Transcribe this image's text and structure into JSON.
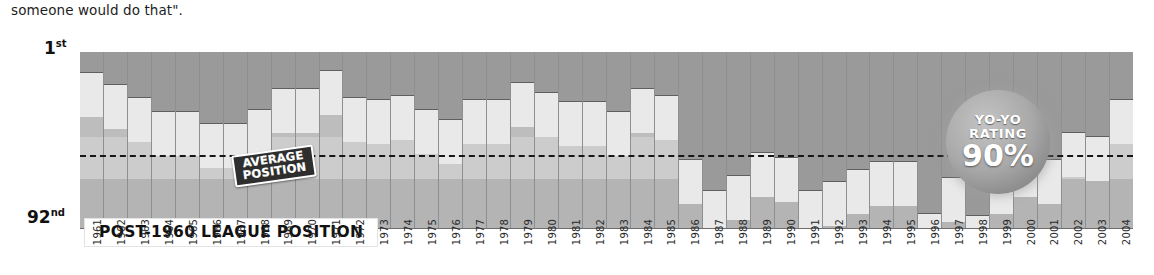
{
  "caption": "someone would do that\".",
  "axis": {
    "top_label": "1",
    "top_sup": "st",
    "bottom_label": "92",
    "bottom_sup": "nd"
  },
  "banner": {
    "text": "POST-1960 LEAGUE POSITION"
  },
  "average_badge": {
    "line1": "AVERAGE",
    "line2": "POSITION"
  },
  "yoyo_badge": {
    "line1": "YO-YO",
    "line2": "RATING",
    "value": "90%"
  },
  "colors": {
    "bar": "#9a9a9a",
    "bar_tail": "#e9e9e9",
    "plot_bg": "#b6b6b6",
    "band_light": "#cccccc",
    "avg_line": "#161616",
    "banner_bg": "#ffffff"
  },
  "chart_data": {
    "type": "bar",
    "title": "POST-1960 LEAGUE POSITION",
    "xlabel": "",
    "ylabel": "League position",
    "ylim": [
      1,
      92
    ],
    "y_inverted": true,
    "grid": false,
    "legend": "none",
    "annotations": [
      "AVERAGE POSITION",
      "YO-YO RATING 90%"
    ],
    "average_position": 46,
    "categories": [
      "1961",
      "1962",
      "1963",
      "1964",
      "1965",
      "1966",
      "1967",
      "1968",
      "1969",
      "1970",
      "1971",
      "1972",
      "1973",
      "1974",
      "1975",
      "1976",
      "1977",
      "1978",
      "1979",
      "1980",
      "1981",
      "1982",
      "1983",
      "1984",
      "1985",
      "1986",
      "1987",
      "1988",
      "1989",
      "1990",
      "1991",
      "1992",
      "1993",
      "1994",
      "1995",
      "1996",
      "1997",
      "1998",
      "1999",
      "2000",
      "2001",
      "2002",
      "2003",
      "2004"
    ],
    "values": [
      12,
      18,
      25,
      32,
      32,
      38,
      38,
      31,
      20,
      20,
      11,
      25,
      26,
      24,
      31,
      36,
      26,
      26,
      17,
      22,
      27,
      27,
      32,
      20,
      24,
      57,
      73,
      65,
      53,
      56,
      73,
      68,
      62,
      58,
      58,
      85,
      66,
      86,
      62,
      53,
      57,
      43,
      45,
      26
    ],
    "value_units": "league position (1st = best, 92nd = worst)"
  }
}
